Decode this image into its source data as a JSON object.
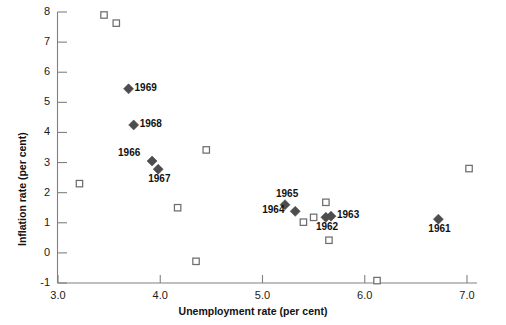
{
  "chart_data": {
    "type": "scatter",
    "title": "",
    "xlabel": "Unemployment rate (per cent)",
    "ylabel": "Inflation rate (per cent)",
    "xlim": [
      3.0,
      7.0
    ],
    "ylim": [
      -1,
      8
    ],
    "xticks": [
      "3.0",
      "4.0",
      "5.0",
      "6.0",
      "7.0"
    ],
    "xtick_values": [
      3.0,
      4.0,
      5.0,
      6.0,
      7.0
    ],
    "yticks": [
      "-1",
      "0",
      "1",
      "2",
      "3",
      "4",
      "5",
      "6",
      "7",
      "8"
    ],
    "ytick_values": [
      -1,
      0,
      1,
      2,
      3,
      4,
      5,
      6,
      7,
      8
    ],
    "grid": false,
    "legend": "none",
    "series": [
      {
        "name": "Labelled years",
        "marker": "filled-diamond",
        "color": "#4d4d4d",
        "points": [
          {
            "label": "1969",
            "x": 3.69,
            "y": 5.45,
            "label_pos": "right"
          },
          {
            "label": "1968",
            "x": 3.74,
            "y": 4.25,
            "label_pos": "right"
          },
          {
            "label": "1966",
            "x": 3.92,
            "y": 3.05,
            "label_pos": "left-above"
          },
          {
            "label": "1967",
            "x": 3.98,
            "y": 2.78,
            "label_pos": "below"
          },
          {
            "label": "1965",
            "x": 5.22,
            "y": 1.6,
            "label_pos": "above"
          },
          {
            "label": "1964",
            "x": 5.32,
            "y": 1.38,
            "label_pos": "left"
          },
          {
            "label": "1963",
            "x": 5.67,
            "y": 1.22,
            "label_pos": "right"
          },
          {
            "label": "1962",
            "x": 5.62,
            "y": 1.18,
            "label_pos": "below"
          },
          {
            "label": "1961",
            "x": 6.72,
            "y": 1.12,
            "label_pos": "below"
          }
        ]
      },
      {
        "name": "Other years",
        "marker": "open-square",
        "color": "#6e6e6e",
        "points": [
          {
            "x": 3.45,
            "y": 7.9
          },
          {
            "x": 3.57,
            "y": 7.63
          },
          {
            "x": 4.45,
            "y": 3.42
          },
          {
            "x": 3.21,
            "y": 2.3
          },
          {
            "x": 4.17,
            "y": 1.5
          },
          {
            "x": 5.62,
            "y": 1.68
          },
          {
            "x": 5.4,
            "y": 1.02
          },
          {
            "x": 5.5,
            "y": 1.18
          },
          {
            "x": 5.65,
            "y": 0.42
          },
          {
            "x": 4.35,
            "y": -0.28
          },
          {
            "x": 6.12,
            "y": -0.92
          },
          {
            "x": 7.02,
            "y": 2.8
          }
        ]
      }
    ]
  },
  "axes": {
    "x_title": "Unemployment rate (per cent)",
    "y_title": "Inflation rate (per cent)"
  },
  "colors": {
    "diamond": "#4d4d4d",
    "square_stroke": "#6e6e6e",
    "axis": "#808080",
    "text": "#111111"
  }
}
